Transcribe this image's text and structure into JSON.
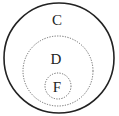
{
  "diagram": {
    "type": "nested-sets",
    "sets": [
      {
        "label": "C",
        "style": "solid",
        "cx": 59,
        "cy": 58,
        "r": 55,
        "label_x": 57,
        "label_y": 25
      },
      {
        "label": "D",
        "style": "dotted",
        "cx": 58,
        "cy": 70,
        "r": 35,
        "label_x": 56,
        "label_y": 64
      },
      {
        "label": "F",
        "style": "dotted",
        "cx": 58,
        "cy": 86,
        "r": 13,
        "label_x": 57,
        "label_y": 92
      }
    ],
    "colors": {
      "stroke": "#222222",
      "dotted_stroke": "#666666",
      "background": "#ffffff"
    }
  }
}
